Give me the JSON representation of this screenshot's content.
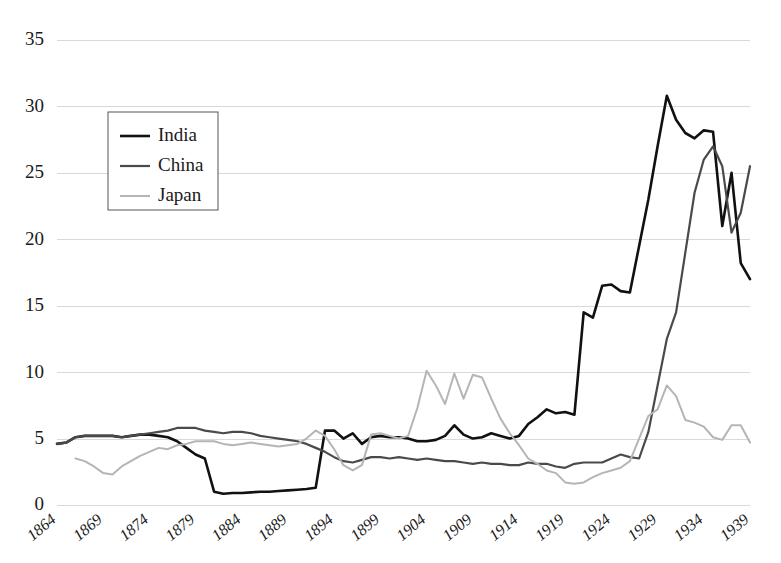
{
  "chart_data": {
    "type": "line",
    "title": "",
    "subtitle": "",
    "xlabel": "",
    "ylabel": "",
    "xlim": [
      1864,
      1939
    ],
    "ylim": [
      0,
      35
    ],
    "grid": true,
    "legend_position": "top-left-inside",
    "ytick_labels": [
      "0",
      "5",
      "10",
      "15",
      "20",
      "25",
      "30",
      "35"
    ],
    "ytick_values": [
      0,
      5,
      10,
      15,
      20,
      25,
      30,
      35
    ],
    "xtick_labels": [
      "1864",
      "1869",
      "1874",
      "1879",
      "1884",
      "1889",
      "1894",
      "1899",
      "1904",
      "1909",
      "1914",
      "1919",
      "1924",
      "1929",
      "1934",
      "1939"
    ],
    "xtick_values": [
      1864,
      1869,
      1874,
      1879,
      1884,
      1889,
      1894,
      1899,
      1904,
      1909,
      1914,
      1919,
      1924,
      1929,
      1934,
      1939
    ],
    "x": [
      1864,
      1865,
      1866,
      1867,
      1868,
      1869,
      1870,
      1871,
      1872,
      1873,
      1874,
      1875,
      1876,
      1877,
      1878,
      1879,
      1880,
      1881,
      1882,
      1883,
      1884,
      1885,
      1886,
      1887,
      1888,
      1889,
      1890,
      1891,
      1892,
      1893,
      1894,
      1895,
      1896,
      1897,
      1898,
      1899,
      1900,
      1901,
      1902,
      1903,
      1904,
      1905,
      1906,
      1907,
      1908,
      1909,
      1910,
      1911,
      1912,
      1913,
      1914,
      1915,
      1916,
      1917,
      1918,
      1919,
      1920,
      1921,
      1922,
      1923,
      1924,
      1925,
      1926,
      1927,
      1928,
      1929,
      1930,
      1931,
      1932,
      1933,
      1934,
      1935,
      1936,
      1937,
      1938,
      1939
    ],
    "series": [
      {
        "name": "India",
        "color": "#111111",
        "width": 2.6,
        "values": [
          4.6,
          4.7,
          5.1,
          5.2,
          5.2,
          5.2,
          5.2,
          5.1,
          5.2,
          5.3,
          5.3,
          5.2,
          5.1,
          4.8,
          4.3,
          3.8,
          3.5,
          1.0,
          0.85,
          0.9,
          0.9,
          0.95,
          1.0,
          1.0,
          1.05,
          1.1,
          1.15,
          1.2,
          1.3,
          5.6,
          5.6,
          5.0,
          5.4,
          4.6,
          5.1,
          5.2,
          5.1,
          5.1,
          5.0,
          4.8,
          4.8,
          4.9,
          5.2,
          6.0,
          5.3,
          5.0,
          5.1,
          5.4,
          5.2,
          5.0,
          5.2,
          6.1,
          6.6,
          7.2,
          6.9,
          7.0,
          6.8,
          14.5,
          14.1,
          16.5,
          16.6,
          16.1,
          16.0,
          19.5,
          23.0,
          27.0,
          30.8,
          29.0,
          28.0,
          27.6,
          28.2,
          28.1,
          21.0,
          25.0,
          18.2,
          17.0
        ]
      },
      {
        "name": "China",
        "color": "#4a4a4a",
        "width": 2.2,
        "values": [
          4.6,
          4.7,
          5.1,
          5.2,
          5.2,
          5.2,
          5.2,
          5.1,
          5.2,
          5.3,
          5.4,
          5.5,
          5.6,
          5.8,
          5.8,
          5.8,
          5.6,
          5.5,
          5.4,
          5.5,
          5.5,
          5.4,
          5.2,
          5.1,
          5.0,
          4.9,
          4.8,
          4.6,
          4.3,
          4.0,
          3.6,
          3.3,
          3.2,
          3.4,
          3.6,
          3.6,
          3.5,
          3.6,
          3.5,
          3.4,
          3.5,
          3.4,
          3.3,
          3.3,
          3.2,
          3.1,
          3.2,
          3.1,
          3.1,
          3.0,
          3.0,
          3.2,
          3.1,
          3.1,
          2.9,
          2.8,
          3.1,
          3.2,
          3.2,
          3.2,
          3.5,
          3.8,
          3.6,
          3.5,
          5.5,
          9.0,
          12.5,
          14.5,
          19.0,
          23.5,
          26.0,
          27.0,
          25.5,
          20.5,
          22.0,
          25.5
        ]
      },
      {
        "name": "Japan",
        "color": "#b5b5b5",
        "width": 2.0,
        "values": [
          null,
          null,
          3.5,
          3.3,
          2.9,
          2.4,
          2.3,
          2.9,
          3.3,
          3.7,
          4.0,
          4.3,
          4.2,
          4.5,
          4.6,
          4.8,
          4.8,
          4.8,
          4.6,
          4.5,
          4.6,
          4.7,
          4.6,
          4.5,
          4.4,
          4.5,
          4.6,
          5.0,
          5.6,
          5.2,
          4.2,
          3.0,
          2.6,
          3.0,
          5.3,
          5.4,
          5.2,
          5.0,
          5.2,
          7.3,
          10.1,
          9.0,
          7.6,
          9.9,
          8.0,
          9.8,
          9.6,
          8.0,
          6.5,
          5.4,
          4.5,
          3.5,
          3.1,
          2.6,
          2.4,
          1.7,
          1.6,
          1.7,
          2.1,
          2.4,
          2.6,
          2.8,
          3.3,
          5.0,
          6.7,
          7.2,
          9.0,
          8.2,
          6.4,
          6.2,
          5.9,
          5.1,
          4.9,
          6.0,
          6.0,
          4.7
        ]
      }
    ]
  },
  "legend": {
    "entries": [
      {
        "label": "India"
      },
      {
        "label": "China"
      },
      {
        "label": "Japan"
      }
    ]
  }
}
